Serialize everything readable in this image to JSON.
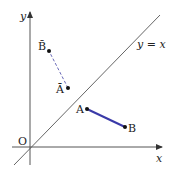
{
  "diagram": {
    "type": "coordinate-reflection",
    "axes": {
      "x_label": "x",
      "y_label": "y",
      "origin_label": "O"
    },
    "line": {
      "label": "y = x",
      "color": "#555555"
    },
    "segment_original": {
      "start_label": "A",
      "end_label": "B",
      "color": "#3a3aa8",
      "style": "solid"
    },
    "segment_reflected": {
      "start_label": "Ā",
      "end_label": "B̄",
      "color": "#5a5ab0",
      "style": "dashed"
    }
  }
}
